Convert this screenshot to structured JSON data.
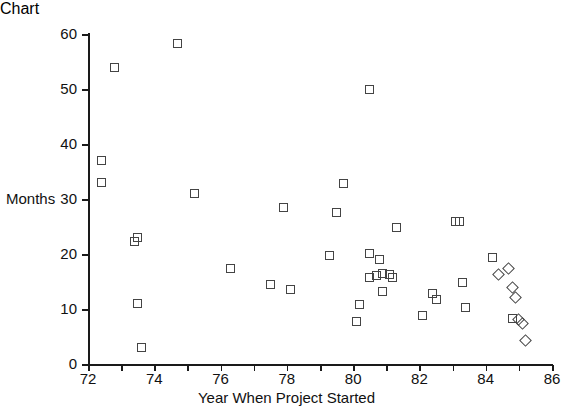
{
  "chart_data": {
    "type": "scatter",
    "title": "",
    "xlabel": "Year When Project Started",
    "ylabel": "Months",
    "xlim": [
      72,
      86
    ],
    "ylim": [
      0,
      60
    ],
    "grid": false,
    "legend": null,
    "x_ticks": [
      72,
      73,
      74,
      75,
      76,
      77,
      78,
      79,
      80,
      81,
      82,
      83,
      84,
      85,
      86
    ],
    "x_tick_labels": [
      "72",
      "",
      "74",
      "",
      "76",
      "",
      "78",
      "",
      "80",
      "",
      "82",
      "",
      "84",
      "",
      "86"
    ],
    "y_ticks": [
      0,
      10,
      20,
      30,
      40,
      50,
      60
    ],
    "y_tick_labels": [
      "0",
      "10",
      "20",
      "30",
      "40",
      "50",
      "60"
    ],
    "marker_style": "open-square",
    "points": [
      {
        "x": 72.4,
        "y": 37.0,
        "shape": "square"
      },
      {
        "x": 72.4,
        "y": 33.0,
        "shape": "square"
      },
      {
        "x": 72.8,
        "y": 54.0,
        "shape": "square"
      },
      {
        "x": 73.5,
        "y": 23.0,
        "shape": "square"
      },
      {
        "x": 73.4,
        "y": 22.2,
        "shape": "square"
      },
      {
        "x": 73.5,
        "y": 11.0,
        "shape": "square"
      },
      {
        "x": 73.6,
        "y": 3.0,
        "shape": "square"
      },
      {
        "x": 74.7,
        "y": 58.3,
        "shape": "square"
      },
      {
        "x": 75.2,
        "y": 31.0,
        "shape": "square"
      },
      {
        "x": 76.3,
        "y": 17.4,
        "shape": "square"
      },
      {
        "x": 77.5,
        "y": 14.4,
        "shape": "square"
      },
      {
        "x": 77.9,
        "y": 28.4,
        "shape": "square"
      },
      {
        "x": 78.1,
        "y": 13.5,
        "shape": "square"
      },
      {
        "x": 79.3,
        "y": 19.8,
        "shape": "square"
      },
      {
        "x": 79.5,
        "y": 27.5,
        "shape": "square"
      },
      {
        "x": 79.7,
        "y": 32.8,
        "shape": "square"
      },
      {
        "x": 80.1,
        "y": 7.8,
        "shape": "square"
      },
      {
        "x": 80.2,
        "y": 10.9,
        "shape": "square"
      },
      {
        "x": 80.5,
        "y": 49.9,
        "shape": "square"
      },
      {
        "x": 80.5,
        "y": 20.1,
        "shape": "square"
      },
      {
        "x": 80.5,
        "y": 15.7,
        "shape": "square"
      },
      {
        "x": 80.7,
        "y": 16.1,
        "shape": "square"
      },
      {
        "x": 80.8,
        "y": 19.0,
        "shape": "square"
      },
      {
        "x": 80.9,
        "y": 16.4,
        "shape": "square"
      },
      {
        "x": 80.9,
        "y": 13.1,
        "shape": "square"
      },
      {
        "x": 81.1,
        "y": 16.3,
        "shape": "square"
      },
      {
        "x": 81.2,
        "y": 15.8,
        "shape": "square"
      },
      {
        "x": 81.3,
        "y": 24.9,
        "shape": "square"
      },
      {
        "x": 82.1,
        "y": 8.8,
        "shape": "square"
      },
      {
        "x": 82.4,
        "y": 12.8,
        "shape": "square"
      },
      {
        "x": 82.5,
        "y": 11.7,
        "shape": "square"
      },
      {
        "x": 83.1,
        "y": 26.0,
        "shape": "square"
      },
      {
        "x": 83.2,
        "y": 26.0,
        "shape": "square"
      },
      {
        "x": 83.3,
        "y": 14.9,
        "shape": "square"
      },
      {
        "x": 83.4,
        "y": 10.2,
        "shape": "square"
      },
      {
        "x": 84.2,
        "y": 19.4,
        "shape": "square"
      },
      {
        "x": 84.4,
        "y": 16.3,
        "shape": "diamond"
      },
      {
        "x": 84.7,
        "y": 17.4,
        "shape": "diamond"
      },
      {
        "x": 84.8,
        "y": 13.9,
        "shape": "diamond"
      },
      {
        "x": 84.9,
        "y": 12.1,
        "shape": "diamond"
      },
      {
        "x": 84.8,
        "y": 8.3,
        "shape": "square"
      },
      {
        "x": 85.0,
        "y": 8.1,
        "shape": "diamond"
      },
      {
        "x": 85.1,
        "y": 7.4,
        "shape": "diamond"
      },
      {
        "x": 85.2,
        "y": 4.2,
        "shape": "diamond"
      }
    ]
  }
}
